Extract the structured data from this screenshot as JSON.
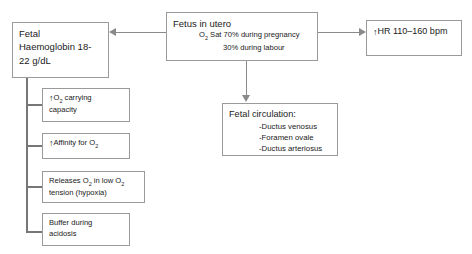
{
  "diagram": {
    "colors": {
      "border": "#9a9a9a",
      "connector": "#8a8a8a",
      "text": "#1a1a1a",
      "background": "#ffffff"
    },
    "nodes": {
      "fetus_in_utero": {
        "title": "Fetus in utero",
        "line2": "O",
        "line2_sub": "2",
        "line2_rest": " Sat 70% during pregnancy",
        "line3": "30% during labour"
      },
      "fetal_haemoglobin": {
        "line1": "Fetal",
        "line2": "Haemoglobin 18-",
        "line3": "22 g/dL"
      },
      "heart_rate": {
        "arrow": "↑",
        "label": "HR 110–160 bpm"
      },
      "fetal_circulation": {
        "title": "Fetal circulation:",
        "items": [
          "-Ductus venosus",
          "-Foramen ovale",
          "-Ductus arteriosus"
        ]
      },
      "o2_carrying": {
        "arrow": "↑",
        "line1_pre": "O",
        "line1_sub": "2",
        "line1_rest": " carrying",
        "line2": "capacity"
      },
      "affinity_o2": {
        "arrow": "↑",
        "line1_pre": "Affinity for O",
        "line1_sub": "2"
      },
      "releases_o2": {
        "line1_a": "Releases O",
        "line1_sub1": "2",
        "line1_b": " in low O",
        "line1_sub2": "2",
        "line2": "tension (hypoxia)"
      },
      "buffer_acidosis": {
        "line1": "Buffer during",
        "line2": "acidosis"
      }
    },
    "connectors": {
      "utero_to_haemoglobin": "arrow-left",
      "utero_to_heart_rate": "arrow-right",
      "utero_to_circulation": "arrow-down",
      "haemoglobin_branch": "bracket"
    }
  }
}
